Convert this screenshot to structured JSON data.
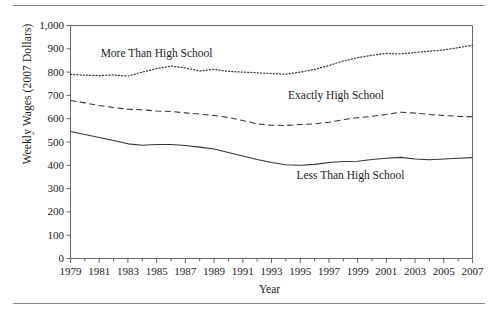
{
  "figure": {
    "has_top_rule": true,
    "has_bottom_rule": true,
    "rule_color": "#8a8a8a"
  },
  "chart_data": {
    "type": "line",
    "title": "",
    "subtitle": "",
    "xlabel": "Year",
    "ylabel": "Weekly Wages (2007 Dollars)",
    "xlim": [
      1979,
      2007
    ],
    "ylim": [
      0,
      1000
    ],
    "grid": false,
    "legend_position": "inline-annotations",
    "x_tick_labels": [
      "1979",
      "1981",
      "1983",
      "1985",
      "1987",
      "1989",
      "1991",
      "1993",
      "1995",
      "1997",
      "1999",
      "2001",
      "2003",
      "2005",
      "2007"
    ],
    "x_tick_values": [
      1979,
      1981,
      1983,
      1985,
      1987,
      1989,
      1991,
      1993,
      1995,
      1997,
      1999,
      2001,
      2003,
      2005,
      2007
    ],
    "x_minor_every": 1,
    "y_tick_labels": [
      "0",
      "100",
      "200",
      "300",
      "400",
      "500",
      "600",
      "700",
      "800",
      "900",
      "1,000"
    ],
    "y_tick_values": [
      0,
      100,
      200,
      300,
      400,
      500,
      600,
      700,
      800,
      900,
      1000
    ],
    "x": [
      1979,
      1980,
      1981,
      1982,
      1983,
      1984,
      1985,
      1986,
      1987,
      1988,
      1989,
      1990,
      1991,
      1992,
      1993,
      1994,
      1995,
      1996,
      1997,
      1998,
      1999,
      2000,
      2001,
      2002,
      2003,
      2004,
      2005,
      2006,
      2007
    ],
    "series": [
      {
        "name": "More Than High School",
        "line_style": "dotted",
        "color": "#333333",
        "label_x": 1985.0,
        "label_y": 880,
        "values": [
          790,
          787,
          785,
          788,
          783,
          800,
          815,
          826,
          818,
          805,
          812,
          803,
          800,
          797,
          794,
          791,
          800,
          812,
          828,
          848,
          862,
          872,
          880,
          878,
          884,
          890,
          895,
          905,
          915
        ]
      },
      {
        "name": "Exactly High School",
        "line_style": "dashed",
        "color": "#333333",
        "label_x": 1997.5,
        "label_y": 700,
        "values": [
          678,
          668,
          657,
          648,
          641,
          638,
          633,
          631,
          625,
          620,
          614,
          605,
          592,
          578,
          572,
          571,
          575,
          578,
          585,
          596,
          604,
          610,
          618,
          628,
          624,
          618,
          614,
          610,
          608
        ]
      },
      {
        "name": "Less Than High School",
        "line_style": "solid",
        "color": "#333333",
        "label_x": 1998.5,
        "label_y": 358,
        "values": [
          545,
          532,
          519,
          506,
          492,
          486,
          489,
          489,
          485,
          478,
          470,
          455,
          440,
          425,
          412,
          402,
          400,
          404,
          412,
          416,
          417,
          425,
          430,
          434,
          427,
          424,
          427,
          430,
          433
        ]
      }
    ]
  }
}
